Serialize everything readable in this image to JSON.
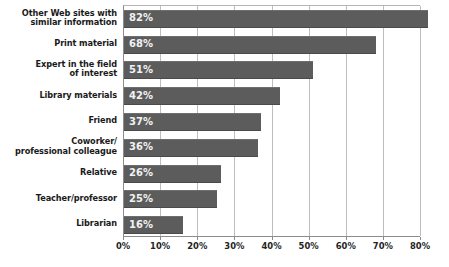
{
  "chart_data": {
    "type": "bar",
    "orientation": "horizontal",
    "title": "",
    "subtitle": "",
    "xlabel": "",
    "ylabel": "",
    "xlim": [
      0,
      80
    ],
    "xticks": [
      0,
      10,
      20,
      30,
      40,
      50,
      60,
      70,
      80
    ],
    "xtick_labels": [
      "0%",
      "10%",
      "20%",
      "30%",
      "40%",
      "50%",
      "60%",
      "70%",
      "80%"
    ],
    "grid": "vertical",
    "legend": "none",
    "categories": [
      "Other Web sites with\nsimilar information",
      "Print material",
      "Expert in the field\nof interest",
      "Library materials",
      "Friend",
      "Coworker/\nprofessional colleague",
      "Relative",
      "Teacher/professor",
      "Librarian"
    ],
    "values": [
      82,
      68,
      51,
      42,
      37,
      36,
      26,
      25,
      16
    ],
    "value_labels": [
      "82%",
      "68%",
      "51%",
      "42%",
      "37%",
      "36%",
      "26%",
      "25%",
      "16%"
    ],
    "bar_color": "#5c5c5c",
    "value_label_color": "#f2f2f2",
    "grid_color": "#bdbdbd",
    "axis_color": "#8c8c8c",
    "background": "#ffffff"
  }
}
